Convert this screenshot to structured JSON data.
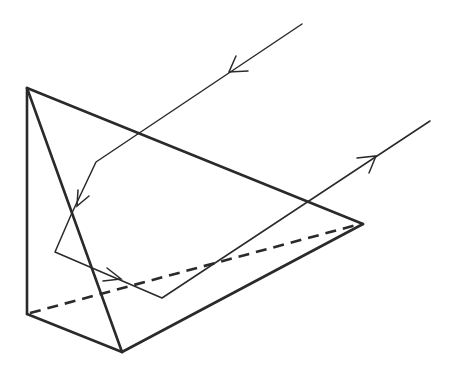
{
  "figure": {
    "title": "",
    "colors": {
      "line": "#2a2a2a",
      "background": "#ffffff"
    }
  },
  "prism": {
    "vertices": {
      "apex": [
        27,
        88
      ],
      "bottom_left": [
        27,
        314
      ],
      "bottom_front": [
        122,
        352
      ],
      "right": [
        363,
        224
      ]
    },
    "edges_solid": [
      [
        "apex",
        "bottom_left"
      ],
      [
        "apex",
        "bottom_front"
      ],
      [
        "apex",
        "right"
      ],
      [
        "bottom_left",
        "bottom_front"
      ],
      [
        "bottom_front",
        "right"
      ]
    ],
    "edges_hidden": [
      [
        "bottom_left",
        "right"
      ]
    ]
  },
  "ray": {
    "path": [
      [
        302,
        24
      ],
      [
        96,
        162
      ],
      [
        71,
        215
      ],
      [
        55,
        252
      ],
      [
        162,
        298
      ],
      [
        430,
        121
      ]
    ],
    "arrows": [
      {
        "label": "incident-arrow",
        "at": [
          230,
          71
        ],
        "direction": "down-left"
      },
      {
        "label": "first-reflection-arrow",
        "at": [
          77,
          204
        ],
        "direction": "down"
      },
      {
        "label": "second-reflection-arrow",
        "at": [
          120,
          280
        ],
        "direction": "right"
      },
      {
        "label": "exit-arrow",
        "at": [
          375,
          158
        ],
        "direction": "up-right"
      }
    ]
  }
}
